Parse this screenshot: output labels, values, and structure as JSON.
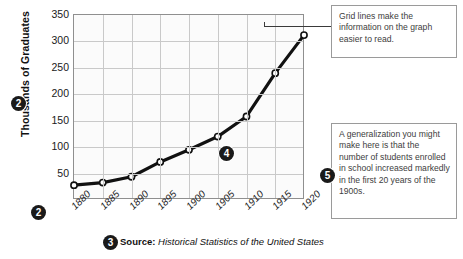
{
  "chart_data": {
    "type": "line",
    "title": "",
    "xlabel": "",
    "ylabel": "Thousands of Graduates",
    "categories": [
      "1880",
      "1885",
      "1890",
      "1895",
      "1900",
      "1905",
      "1910",
      "1915",
      "1920"
    ],
    "values": [
      28,
      33,
      44,
      72,
      95,
      120,
      158,
      240,
      312
    ],
    "series": [
      {
        "name": "High school graduates",
        "values": [
          28,
          33,
          44,
          72,
          95,
          120,
          158,
          240,
          312
        ]
      }
    ],
    "ylim": [
      0,
      350
    ],
    "y_ticks": [
      "50",
      "100",
      "150",
      "200",
      "250",
      "300",
      "350"
    ],
    "y_tick_values": [
      50,
      100,
      150,
      200,
      250,
      300,
      350
    ],
    "x_ticks": [
      "1880",
      "1885",
      "1890",
      "1895",
      "1900",
      "1905",
      "1910",
      "1915",
      "1920"
    ],
    "grid": true,
    "legend": "none",
    "marker": "open-circle",
    "line_color": "#111111",
    "grid_color": "#c9c9c9",
    "plot_background": "#fbfbfb"
  },
  "axes": {
    "y_title": "Thousands of Graduates",
    "y_ticks": [
      "350",
      "300",
      "250",
      "200",
      "150",
      "100",
      "50"
    ],
    "x_ticks": [
      "1880",
      "1885",
      "1890",
      "1895",
      "1900",
      "1905",
      "1910",
      "1915",
      "1920"
    ]
  },
  "source": {
    "label": "Source:",
    "text": "Historical Statistics of the United States"
  },
  "callouts": [
    {
      "id": "grid-lines",
      "text": "Grid lines make the information on the graph easier to read."
    },
    {
      "id": "generalization",
      "text": "A generalization you might make here is that the number of students enrolled in school increased markedly in the first 20 years of the 1900s."
    }
  ],
  "badges": {
    "y_axis": "2",
    "x_axis": "2",
    "source": "3",
    "data_line": "4",
    "generalization": "5"
  }
}
